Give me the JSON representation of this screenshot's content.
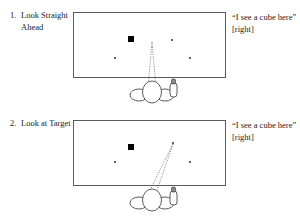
{
  "figure": {
    "panels": [
      {
        "number": "1.",
        "title": "Look Straight Ahead",
        "quote": "“I see a cube here” [right]",
        "scene": {
          "cube": {
            "x": 131,
            "y": 39,
            "size": 6,
            "color": "#000000"
          },
          "dots": [
            {
              "name": "dot-left",
              "x": 115,
              "y": 58,
              "size": 1.6
            },
            {
              "name": "dot-upper-right",
              "x": 172,
              "y": 40,
              "size": 1.6
            },
            {
              "name": "dot-lower-right",
              "x": 190,
              "y": 58,
              "size": 1.6
            }
          ],
          "gaze": {
            "direction": "straight-ahead",
            "apex_x": 152,
            "apex_y": 42,
            "base_left_x": 148,
            "base_right_x": 156,
            "base_y": 88
          }
        },
        "observer": {
          "head_cx": 152,
          "head_cy": 92,
          "head_rx": 9.5,
          "head_ry": 11,
          "shoulder_left_cx": 139,
          "shoulder_right_cx": 165,
          "shoulder_cy": 95,
          "shoulder_rx": 9,
          "shoulder_ry": 6,
          "pointer_x": 172,
          "pointer_y": 80,
          "pointer_w": 7,
          "pointer_h": 17
        }
      },
      {
        "number": "2.",
        "title": "Look at Target",
        "quote": "“I see a cube here” [right]",
        "scene": {
          "cube": {
            "x": 131,
            "y": 39,
            "size": 6,
            "color": "#000000"
          },
          "dots": [
            {
              "name": "dot-left",
              "x": 115,
              "y": 54,
              "size": 1.6
            },
            {
              "name": "dot-target-upper-right",
              "x": 173,
              "y": 35,
              "size": 1.6
            },
            {
              "name": "dot-lower-right",
              "x": 190,
              "y": 54,
              "size": 1.6
            }
          ],
          "gaze": {
            "direction": "toward-target-upper-right",
            "apex_x": 173,
            "apex_y": 36,
            "base_left_x": 147,
            "base_right_x": 155,
            "base_y": 88
          }
        },
        "observer": {
          "head_cx": 152,
          "head_cy": 92,
          "head_rx": 9.5,
          "head_ry": 11,
          "shoulder_left_cx": 139,
          "shoulder_right_cx": 165,
          "shoulder_cy": 95,
          "shoulder_rx": 9,
          "shoulder_ry": 6,
          "pointer_x": 172,
          "pointer_y": 80,
          "pointer_w": 7,
          "pointer_h": 17
        }
      }
    ]
  },
  "colors": {
    "box_border": "#5a5a5a",
    "cube": "#000000",
    "gaze_line": "#5e5e5e",
    "ink": "#1a1a1a"
  }
}
